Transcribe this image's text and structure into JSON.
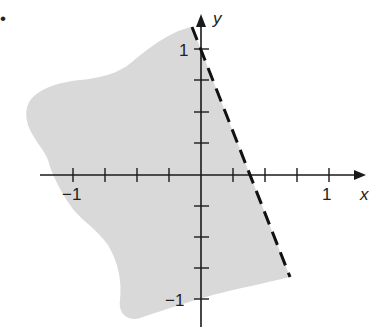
{
  "figure": {
    "type": "inequality-region-graph",
    "marker_dot": "•",
    "axes": {
      "x_label": "x",
      "y_label": "y",
      "x_tick_labels": {
        "neg": "−1",
        "pos": "1"
      },
      "y_tick_labels": {
        "pos": "1",
        "neg": "−1"
      },
      "tick_step": 0.25,
      "x_range": [
        -1,
        1
      ],
      "y_range": [
        -1,
        1
      ]
    },
    "boundary_line": {
      "style": "dashed",
      "from": [
        -0.07,
        1.17
      ],
      "to": [
        0.7,
        -0.82
      ]
    },
    "shaded_region": {
      "side": "left of dashed line",
      "color": "#d9d9d9"
    },
    "colors": {
      "axis": "#1a1a1a",
      "shade": "#d9d9d9",
      "dash": "#111111"
    }
  }
}
